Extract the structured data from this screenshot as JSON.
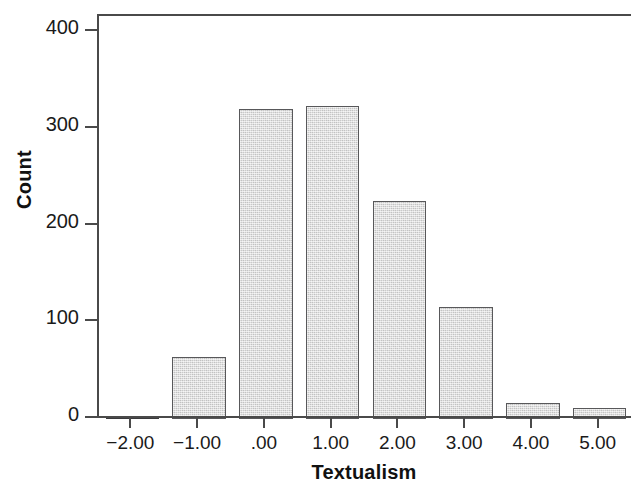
{
  "chart_data": {
    "type": "bar",
    "title": "",
    "subtitle": "",
    "xlabel": "Textualism",
    "ylabel": "Count",
    "categories": [
      "-2.00",
      "-1.00",
      ".00",
      "1.00",
      "2.00",
      "3.00",
      "4.00",
      "5.00"
    ],
    "values": [
      2,
      64,
      320,
      324,
      225,
      116,
      17,
      11
    ],
    "x_tick_labels": [
      "−2.00",
      "−1.00",
      ".00",
      "1.00",
      "2.00",
      "3.00",
      "4.00",
      "5.00"
    ],
    "y_tick_labels": [
      "0",
      "100",
      "200",
      "300",
      "400"
    ],
    "y_tick_values": [
      0,
      100,
      200,
      300,
      400
    ],
    "ylim": [
      0,
      416
    ],
    "xlim": [
      -2.75,
      5.75
    ],
    "grid": false,
    "legend": null,
    "legend_position": "none",
    "annotations": [],
    "colors": {
      "bar_fill": "#d8d8d8",
      "bar_edge": "#58585a",
      "axis": "#4a4a4a",
      "text": "#1a1a1a",
      "background": "#ffffff"
    }
  }
}
